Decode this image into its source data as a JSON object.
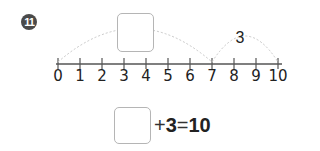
{
  "problem": {
    "number": "11"
  },
  "number_line": {
    "min": 0,
    "max": 10,
    "labels": [
      "0",
      "1",
      "2",
      "3",
      "4",
      "5",
      "6",
      "7",
      "8",
      "9",
      "10"
    ],
    "jumps": [
      {
        "from": 0,
        "to": 7,
        "label": ""
      },
      {
        "from": 7,
        "to": 10,
        "label": "3"
      }
    ]
  },
  "equation": {
    "blank": "",
    "plus": "+",
    "addend": "3",
    "equals": "=",
    "result": "10"
  },
  "colors": {
    "badge": "#4a4a4a",
    "line": "#555555",
    "arc": "#c8c8c8",
    "box_border": "#b5b5b5"
  }
}
